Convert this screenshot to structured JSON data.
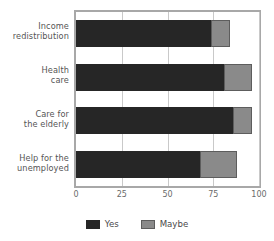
{
  "chart_data": {
    "type": "bar",
    "orientation": "horizontal",
    "stacked": true,
    "title": "",
    "subtitle": "",
    "xlabel": "",
    "ylabel": "",
    "xlim": [
      0,
      100
    ],
    "xticks": [
      0,
      25,
      50,
      75,
      100
    ],
    "xticklabels": [
      "0",
      "25",
      "50",
      "75",
      "100"
    ],
    "grid": "vertical",
    "legend_position": "bottom-center",
    "categories": [
      "Income redistribution",
      "Health care",
      "Care for the elderly",
      "Help for the unemployed"
    ],
    "category_lines": [
      [
        "Income",
        "redistribution"
      ],
      [
        "Health",
        "care"
      ],
      [
        "Care for",
        "the elderly"
      ],
      [
        "Help for the",
        "unemployed"
      ]
    ],
    "series": [
      {
        "name": "Yes",
        "color": "#262626",
        "values": [
          74,
          81,
          86,
          68
        ]
      },
      {
        "name": "Maybe",
        "color": "#8a8a8a",
        "values": [
          10,
          15,
          10,
          20
        ]
      }
    ],
    "totals": [
      84,
      96,
      96,
      88
    ]
  },
  "legend": {
    "items": [
      {
        "label": "Yes",
        "swatch": "yes"
      },
      {
        "label": "Maybe",
        "swatch": "maybe"
      }
    ]
  },
  "colors": {
    "yes": "#262626",
    "maybe": "#8a8a8a",
    "frame": "#a8a8a8",
    "gridline": "#c9c9c9",
    "text": "#4a4a4a",
    "background": "#ffffff"
  }
}
